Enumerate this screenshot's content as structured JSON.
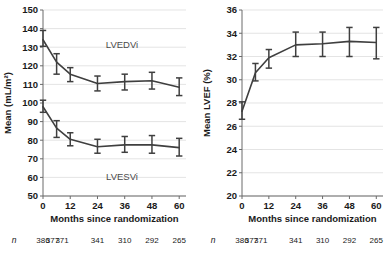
{
  "figure": {
    "panels": [
      {
        "id": "left",
        "name": "ventricular-volume-panel",
        "y_axis_title": "Mean (mL/m²)",
        "x_axis_title": "Months since randomization",
        "y_ticks": [
          "50",
          "60",
          "70",
          "80",
          "90",
          "100",
          "110",
          "120",
          "130",
          "140",
          "150"
        ],
        "x_ticks": [
          "0",
          "12",
          "24",
          "36",
          "48",
          "60"
        ],
        "n_symbol": "n",
        "n_values": [
          "386",
          "377",
          "371",
          "341",
          "310",
          "292",
          "265"
        ],
        "series_labels": [
          "LVEDVi",
          "LVESVi"
        ]
      },
      {
        "id": "right",
        "name": "ejection-fraction-panel",
        "y_axis_title": "Mean LVEF (%)",
        "x_axis_title": "Months since randomization",
        "y_ticks": [
          "20",
          "22",
          "24",
          "26",
          "28",
          "30",
          "32",
          "34",
          "36"
        ],
        "x_ticks": [
          "0",
          "12",
          "24",
          "36",
          "48",
          "60"
        ],
        "n_symbol": "n",
        "n_values": [
          "386",
          "377",
          "371",
          "341",
          "310",
          "292",
          "265"
        ],
        "series_labels": []
      }
    ]
  },
  "chart_data": [
    {
      "type": "line",
      "id": "left",
      "title": "",
      "xlabel": "Months since randomization",
      "ylabel": "Mean (mL/m²)",
      "xlim": [
        0,
        63
      ],
      "ylim": [
        50,
        150
      ],
      "xticks": [
        0,
        12,
        24,
        36,
        48,
        60
      ],
      "yticks": [
        50,
        60,
        70,
        80,
        90,
        100,
        110,
        120,
        130,
        140,
        150
      ],
      "grid": true,
      "legend": "none",
      "x": [
        0,
        4,
        6,
        12,
        24,
        36,
        48,
        60
      ],
      "series": [
        {
          "name": "LVEDVi",
          "annotation": "LVEDVi",
          "x": [
            0,
            6,
            12,
            24,
            36,
            48,
            60
          ],
          "values": [
            134.0,
            122.0,
            115.5,
            110.5,
            111.5,
            112.0,
            108.5
          ],
          "err_low": [
            130.5,
            115.5,
            111.5,
            106.5,
            107.0,
            107.5,
            104.0
          ],
          "err_high": [
            139.0,
            126.5,
            119.0,
            114.5,
            115.5,
            116.5,
            113.5
          ]
        },
        {
          "name": "LVESVi",
          "annotation": "LVESVi",
          "x": [
            0,
            6,
            12,
            24,
            36,
            48,
            60
          ],
          "values": [
            98.0,
            86.5,
            80.5,
            76.5,
            77.5,
            77.5,
            76.0
          ],
          "err_low": [
            95.0,
            81.5,
            77.0,
            73.0,
            73.5,
            73.0,
            71.5
          ],
          "err_high": [
            101.5,
            90.5,
            84.0,
            80.5,
            82.0,
            82.5,
            81.0
          ]
        }
      ]
    },
    {
      "type": "line",
      "id": "right",
      "title": "",
      "xlabel": "Months since randomization",
      "ylabel": "Mean LVEF (%)",
      "xlim": [
        0,
        63
      ],
      "ylim": [
        20,
        36
      ],
      "xticks": [
        0,
        12,
        24,
        36,
        48,
        60
      ],
      "yticks": [
        20,
        22,
        24,
        26,
        28,
        30,
        32,
        34,
        36
      ],
      "grid": true,
      "legend": "none",
      "x": [
        0,
        6,
        12,
        24,
        36,
        48,
        60
      ],
      "series": [
        {
          "name": "Mean LVEF",
          "annotation": "",
          "x": [
            0,
            6,
            12,
            24,
            36,
            48,
            60
          ],
          "values": [
            27.3,
            30.6,
            31.9,
            33.0,
            33.1,
            33.3,
            33.2
          ],
          "err_low": [
            26.6,
            29.9,
            31.0,
            32.0,
            32.0,
            32.0,
            31.8
          ],
          "err_high": [
            28.1,
            31.4,
            32.6,
            34.1,
            34.1,
            34.5,
            34.5
          ]
        }
      ]
    }
  ]
}
